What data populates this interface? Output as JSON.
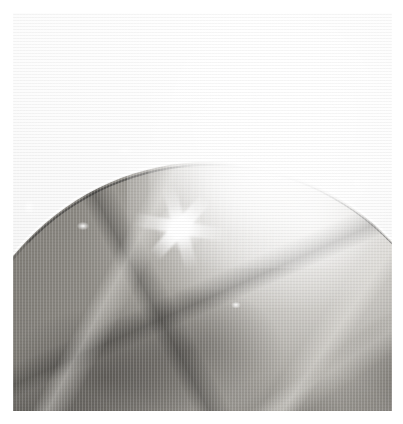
{
  "page": {
    "kind": "scanned-photographic-plate",
    "width": 403,
    "height": 424,
    "background_color": "#ffffff",
    "caption": ""
  },
  "frame": {
    "name": "photo-border",
    "left": 13,
    "top": 13,
    "width": 379,
    "height": 398,
    "line_color": "#b9b9b9",
    "interactable": false
  },
  "photo": {
    "title": "",
    "alt_text": "Grayscale photograph of a shallow round dish holding dark clumped organic material, with strong camera-flash glare across the upper right and a bright specular starburst near the centre.",
    "medium": "halftone print / scan",
    "palette": {
      "paper_white": "#fbfbfb",
      "highlight_white": "#ffffff",
      "rim_highlight": "#f4f3f1",
      "midtone_gray": "#a6a39d",
      "shadow_gray": "#6f6d67",
      "deep_shadow": "#2c2a28"
    },
    "subjects": [
      {
        "name": "round-dish",
        "description": "shallow circular dish, upper arc of the rim visible crossing the frame",
        "rim_highlight": "bright specular line along the upper arc"
      },
      {
        "name": "organic-material",
        "description": "dark angular clumps filling the lower two thirds of the dish"
      },
      {
        "name": "flash-glare",
        "description": "blown-out white flash reflection occupying the upper right quadrant"
      },
      {
        "name": "specular-starburst",
        "description": "four-rayed white highlight near the centre of the dish"
      }
    ],
    "background_region": {
      "name": "upper-background",
      "description": "near-white empty paper above the dish rim"
    }
  }
}
